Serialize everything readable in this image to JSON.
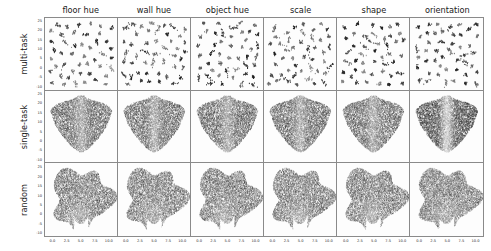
{
  "figure": {
    "title": "",
    "columns": [
      "floor hue",
      "wall hue",
      "object hue",
      "scale",
      "shape",
      "orientation"
    ],
    "rows": [
      "multi-task",
      "single-task",
      "random"
    ]
  },
  "chart_data": {
    "type": "scatter",
    "title": "",
    "xlabel": "",
    "ylabel": "",
    "grid": false,
    "legend_position": "none",
    "n_rows": 3,
    "n_cols": 6,
    "row_labels": [
      "multi-task",
      "single-task",
      "random"
    ],
    "col_labels": [
      "floor hue",
      "wall hue",
      "object hue",
      "scale",
      "shape",
      "orientation"
    ],
    "xlim": [
      -1.5,
      11.5
    ],
    "ylim": [
      -12.0,
      27.0
    ],
    "xticks": [
      0.0,
      2.5,
      5.0,
      7.5,
      10.0
    ],
    "xticklabels": [
      "0.0",
      "2.5",
      "5.0",
      "7.5",
      "10.0"
    ],
    "yticks": [
      25,
      20,
      15,
      10,
      5,
      0,
      -5,
      -10
    ],
    "yticklabels": [
      "25",
      "20",
      "15",
      "10",
      "5",
      "0",
      "-5",
      "-10"
    ],
    "colormap": "grayscale",
    "point_color_low": "#f2f2f2",
    "point_color_high": "#1a1a1a",
    "panels": [
      {
        "row": "multi-task",
        "col": "floor hue",
        "structure": "discrete-clusters",
        "n_clusters": 46,
        "cluster_spread": 0.3,
        "points_per_cluster": 14,
        "density": "sparse",
        "background": "light",
        "description": "well separated small clusters scattered across the embedding"
      },
      {
        "row": "multi-task",
        "col": "wall hue",
        "structure": "discrete-clusters",
        "n_clusters": 46,
        "cluster_spread": 0.3,
        "points_per_cluster": 14,
        "density": "sparse",
        "background": "light",
        "description": "well separated small clusters scattered across the embedding"
      },
      {
        "row": "multi-task",
        "col": "object hue",
        "structure": "discrete-clusters",
        "n_clusters": 46,
        "cluster_spread": 0.3,
        "points_per_cluster": 14,
        "density": "sparse",
        "background": "light",
        "description": "well separated small clusters scattered across the embedding"
      },
      {
        "row": "multi-task",
        "col": "scale",
        "structure": "discrete-clusters",
        "n_clusters": 46,
        "cluster_spread": 0.3,
        "points_per_cluster": 14,
        "density": "sparse",
        "background": "light",
        "description": "well separated small clusters scattered across the embedding"
      },
      {
        "row": "multi-task",
        "col": "shape",
        "structure": "discrete-clusters",
        "n_clusters": 46,
        "cluster_spread": 0.3,
        "points_per_cluster": 14,
        "density": "sparse",
        "background": "light",
        "description": "well separated small clusters scattered across the embedding"
      },
      {
        "row": "multi-task",
        "col": "orientation",
        "structure": "discrete-clusters",
        "n_clusters": 46,
        "cluster_spread": 0.3,
        "points_per_cluster": 14,
        "density": "sparse",
        "background": "light",
        "description": "well separated small clusters, strong dark/light value contrast"
      },
      {
        "row": "single-task",
        "col": "floor hue",
        "structure": "bowtie-blob",
        "density": "dense",
        "background": "mid-gray",
        "description": "single dense butterfly shaped manifold with a notch at the top centre"
      },
      {
        "row": "single-task",
        "col": "wall hue",
        "structure": "bowtie-blob",
        "density": "dense",
        "background": "mid-gray",
        "description": "single dense butterfly shaped manifold with a notch at the top centre"
      },
      {
        "row": "single-task",
        "col": "object hue",
        "structure": "bowtie-blob",
        "density": "dense",
        "background": "mid-gray",
        "description": "single dense butterfly shaped manifold with a notch at the top centre"
      },
      {
        "row": "single-task",
        "col": "scale",
        "structure": "bowtie-blob",
        "density": "dense",
        "background": "mid-gray",
        "description": "single dense butterfly shaped manifold with a notch at the top centre"
      },
      {
        "row": "single-task",
        "col": "shape",
        "structure": "bowtie-blob",
        "density": "dense",
        "background": "mid-gray",
        "description": "single dense manifold, slightly rounder right lobe"
      },
      {
        "row": "single-task",
        "col": "orientation",
        "structure": "bowtie-blob",
        "density": "dense",
        "background": "high-contrast",
        "description": "two dark lobes separated by a light vertical band through the centre"
      },
      {
        "row": "random",
        "col": "floor hue",
        "structure": "diffuse-blob",
        "density": "dense",
        "background": "mid-gray",
        "description": "unstructured irregular cloud filling the panel"
      },
      {
        "row": "random",
        "col": "wall hue",
        "structure": "diffuse-blob",
        "density": "dense",
        "background": "mid-gray",
        "description": "unstructured irregular cloud filling the panel"
      },
      {
        "row": "random",
        "col": "object hue",
        "structure": "diffuse-blob",
        "density": "dense",
        "background": "mid-gray",
        "description": "unstructured irregular cloud filling the panel"
      },
      {
        "row": "random",
        "col": "scale",
        "structure": "diffuse-blob",
        "density": "dense",
        "background": "mid-gray",
        "description": "unstructured irregular cloud filling the panel"
      },
      {
        "row": "random",
        "col": "shape",
        "structure": "diffuse-blob",
        "density": "dense",
        "background": "mid-gray",
        "description": "unstructured irregular cloud filling the panel"
      },
      {
        "row": "random",
        "col": "orientation",
        "structure": "diffuse-blob",
        "density": "dense",
        "background": "mid-gray",
        "description": "unstructured irregular cloud filling the panel"
      }
    ]
  }
}
